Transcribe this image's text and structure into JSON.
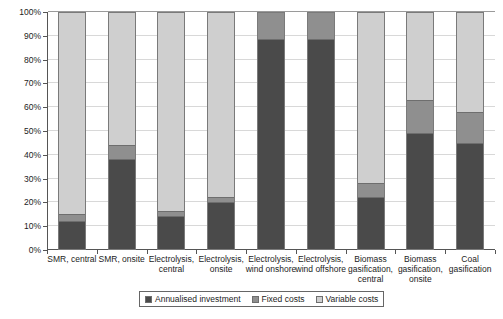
{
  "chart_data": {
    "type": "bar",
    "stacked": true,
    "stack_mode": "percent",
    "title": "",
    "subtitle": "",
    "xlabel": "",
    "ylabel": "",
    "ylim": [
      0,
      100
    ],
    "grid": true,
    "legend_position": "bottom",
    "categories": [
      "SMR, central",
      "SMR, onsite",
      "Electrolysis, central",
      "Electrolysis, onsite",
      "Electrolysis, wind onshore",
      "Electrolysis, wind offshore",
      "Biomass gasification, central",
      "Biomass gasification, onsite",
      "Coal gasification"
    ],
    "ytick_labels": [
      "0%",
      "10%",
      "20%",
      "30%",
      "40%",
      "50%",
      "60%",
      "70%",
      "80%",
      "90%",
      "100%"
    ],
    "ytick_values": [
      0,
      10,
      20,
      30,
      40,
      50,
      60,
      70,
      80,
      90,
      100
    ],
    "series": [
      {
        "name": "Annualised investment",
        "color": "#4a4a4a",
        "values": [
          12,
          38,
          14,
          20,
          89,
          89,
          22,
          49,
          45
        ]
      },
      {
        "name": "Fixed costs",
        "color": "#8f8f8f",
        "values": [
          3,
          6,
          2,
          2,
          11,
          11,
          6,
          14,
          13
        ]
      },
      {
        "name": "Variable costs",
        "color": "#cfcfcf",
        "values": [
          85,
          56,
          84,
          78,
          0,
          0,
          72,
          37,
          42
        ]
      }
    ]
  },
  "legend": {
    "items": [
      {
        "label": "Annualised investment",
        "swatch": "invest"
      },
      {
        "label": "Fixed costs",
        "swatch": "fixed"
      },
      {
        "label": "Variable costs",
        "swatch": "variable"
      }
    ]
  }
}
